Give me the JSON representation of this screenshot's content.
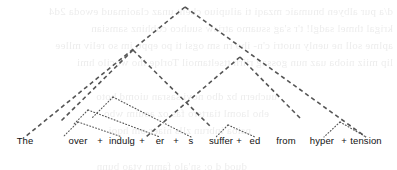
{
  "figure": {
    "type": "morphosyntactic-tree",
    "width": 397,
    "height": 170,
    "background_color": "#ffffff",
    "line_color": "#555555",
    "text_color": "#111111",
    "sentence": "The over + indulg + er + s  suffer + ed  from  hyper + tension",
    "join_symbol": "+"
  },
  "leaves": [
    {
      "id": "leaf-the",
      "label": "The",
      "x": 25,
      "y": 144
    },
    {
      "id": "leaf-over",
      "label": "over",
      "x": 78,
      "y": 144
    },
    {
      "id": "leaf-indulg",
      "label": "indulg",
      "x": 122,
      "y": 144
    },
    {
      "id": "leaf-er",
      "label": "er",
      "x": 160,
      "y": 144
    },
    {
      "id": "leaf-s",
      "label": "s",
      "x": 191,
      "y": 144
    },
    {
      "id": "leaf-suffer",
      "label": "suffer",
      "x": 221,
      "y": 144
    },
    {
      "id": "leaf-ed",
      "label": "ed",
      "x": 255,
      "y": 144
    },
    {
      "id": "leaf-from",
      "label": "from",
      "x": 286,
      "y": 144
    },
    {
      "id": "leaf-hyper",
      "label": "hyper",
      "x": 322,
      "y": 144
    },
    {
      "id": "leaf-tension",
      "label": "tension",
      "x": 366,
      "y": 144
    }
  ],
  "joins": [
    {
      "id": "join-over-indulg",
      "label": "+",
      "x": 100,
      "y": 144
    },
    {
      "id": "join-indulg-er",
      "label": "+",
      "x": 142,
      "y": 144
    },
    {
      "id": "join-er-s",
      "label": "+",
      "x": 176,
      "y": 144
    },
    {
      "id": "join-suffer-ed",
      "label": "+",
      "x": 239,
      "y": 144
    },
    {
      "id": "join-hyper-tension",
      "label": "+",
      "x": 344,
      "y": 144
    }
  ],
  "nodes": [
    {
      "id": "node-root",
      "name": "root-node",
      "x": 185,
      "y": 7,
      "style": "dashed"
    },
    {
      "id": "node-np-subject",
      "name": "subject-np-node",
      "x": 133,
      "y": 50,
      "style": "dashed"
    },
    {
      "id": "node-nbar",
      "name": "nbar-node",
      "x": 113,
      "y": 97,
      "style": "dotted"
    },
    {
      "id": "node-stem-er",
      "name": "deriv-er-node",
      "x": 88,
      "y": 110,
      "style": "dotted"
    },
    {
      "id": "node-over-indulg",
      "name": "over-indulg-node",
      "x": 78,
      "y": 122,
      "style": "dotted"
    },
    {
      "id": "node-vp",
      "name": "vp-node",
      "x": 228,
      "y": 125,
      "style": "dotted"
    },
    {
      "id": "node-pp",
      "name": "pp-node",
      "x": 340,
      "y": 122,
      "style": "dotted"
    }
  ],
  "edges": [
    {
      "id": "edge-root-left",
      "name": "root-to-subject-edge",
      "from": [
        185,
        7
      ],
      "to": [
        25,
        137
      ],
      "style": "dashed"
    },
    {
      "id": "edge-root-right",
      "name": "root-to-predicate-edge",
      "from": [
        185,
        7
      ],
      "to": [
        366,
        137
      ],
      "style": "dashed"
    },
    {
      "id": "edge-np-apex-left",
      "name": "np-left-edge",
      "from": [
        133,
        50
      ],
      "to": [
        60,
        122
      ],
      "style": "dashed"
    },
    {
      "id": "edge-np-apex-right",
      "name": "np-right-edge",
      "from": [
        133,
        50
      ],
      "to": [
        212,
        128
      ],
      "style": "dashed"
    },
    {
      "id": "edge-mid-left",
      "name": "vp-left-edge",
      "from": [
        240,
        57
      ],
      "to": [
        146,
        137
      ],
      "style": "dashed"
    },
    {
      "id": "edge-mid-right",
      "name": "vp-right-edge",
      "from": [
        240,
        57
      ],
      "to": [
        300,
        118
      ],
      "style": "dashed"
    },
    {
      "id": "edge-nbar-left",
      "name": "nbar-left-edge",
      "from": [
        113,
        97
      ],
      "to": [
        92,
        118
      ],
      "style": "dotted"
    },
    {
      "id": "edge-nbar-right",
      "name": "nbar-right-edge",
      "from": [
        113,
        97
      ],
      "to": [
        191,
        137
      ],
      "style": "dotted"
    },
    {
      "id": "edge-er-left",
      "name": "er-left-edge",
      "from": [
        88,
        110
      ],
      "to": [
        74,
        124
      ],
      "style": "dotted"
    },
    {
      "id": "edge-er-right",
      "name": "er-right-edge",
      "from": [
        88,
        110
      ],
      "to": [
        160,
        137
      ],
      "style": "dotted"
    },
    {
      "id": "edge-oi-left",
      "name": "over-left-edge",
      "from": [
        78,
        122
      ],
      "to": [
        63,
        137
      ],
      "style": "dotted"
    },
    {
      "id": "edge-oi-right",
      "name": "indulg-right-edge",
      "from": [
        78,
        122
      ],
      "to": [
        122,
        137
      ],
      "style": "dotted"
    },
    {
      "id": "edge-vp-left",
      "name": "suffer-edge",
      "from": [
        228,
        125
      ],
      "to": [
        216,
        137
      ],
      "style": "dotted"
    },
    {
      "id": "edge-vp-right",
      "name": "ed-edge",
      "from": [
        228,
        125
      ],
      "to": [
        255,
        137
      ],
      "style": "dotted"
    },
    {
      "id": "edge-pp-left",
      "name": "hyper-edge",
      "from": [
        340,
        122
      ],
      "to": [
        324,
        137
      ],
      "style": "dotted"
    },
    {
      "id": "edge-pp-right",
      "name": "tension-edge",
      "from": [
        340,
        122
      ],
      "to": [
        366,
        137
      ],
      "style": "dotted"
    }
  ],
  "bleed_text": {
    "note": "faint show-through text from reverse side of page",
    "lines": [
      {
        "text": "d/a pur albyen bnumaic mzaqi ti ailupiuo chent unaz claoimaud ewoda 2d4",
        "x": 4,
        "y": 3
      },
      {
        "text": "krigal thmel sadgl!  t'r s'ag ssuamo  atrisw suuhco  cobhinz samsian",
        "x": 4,
        "y": 20
      },
      {
        "text": "aplme soll ne  uenly nuotri  c'n-  iho rn  sm ogsi ti  po eppu jm so reliv mllee",
        "x": 4,
        "y": 37
      },
      {
        "text": "lip miiz nioba uaz nun gossag riirh ttseltamoil  Torlqe iho wocilo hmi",
        "x": 4,
        "y": 54
      },
      {
        "text": "uuchern bz dbo novi  sasran uiomd hoto",
        "x": 120,
        "y": 88
      },
      {
        "text": "eho laoml tiartsro fas oz aouim wbo",
        "x": 128,
        "y": 105
      },
      {
        "text": "nsioa inbrun zlls niaer om hqoi",
        "x": 146,
        "y": 122
      },
      {
        "text": "duod d o: sn'alo famm  vtao bunn",
        "x": 150,
        "y": 158
      }
    ]
  }
}
